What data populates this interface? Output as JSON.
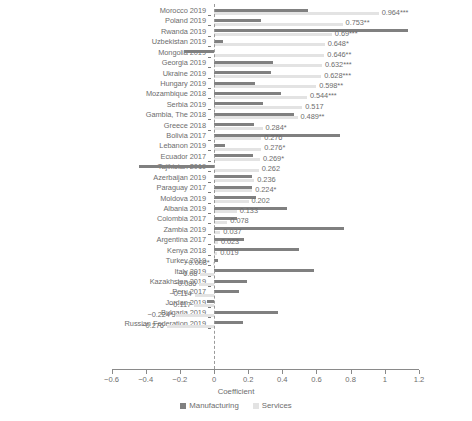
{
  "chart_data": {
    "type": "bar",
    "orientation": "horizontal",
    "title": "",
    "xlabel": "Coefficient",
    "ylabel": "",
    "xlim": [
      -0.6,
      1.2
    ],
    "xticks": [
      -0.6,
      -0.4,
      -0.2,
      0,
      0.2,
      0.4,
      0.6,
      0.8,
      1,
      1.2
    ],
    "xtick_labels": [
      "−0.6",
      "−0.4",
      "−0.2",
      "0",
      "0.2",
      "0.4",
      "0.6",
      "0.8",
      "1",
      "1.2"
    ],
    "grid": false,
    "legend_position": "bottom",
    "zero_reference_line": true,
    "categories": [
      "Morocco 2019",
      "Poland 2019",
      "Rwanda 2019",
      "Uzbekistan 2019",
      "Mongolia 2019",
      "Georgia 2019",
      "Ukraine 2019",
      "Hungary 2019",
      "Mozambique 2018",
      "Serbia 2019",
      "Gambia, The 2018",
      "Greece 2018",
      "Bolivia 2017",
      "Lebanon 2019",
      "Ecuador 2017",
      "Tajikistan 2019",
      "Azerbaijan 2019",
      "Paraguay 2017",
      "Moldova 2019",
      "Albania 2019",
      "Colombia 2017",
      "Zambia 2019",
      "Argentina 2017",
      "Kenya 2018",
      "Turkey 2019",
      "Italy 2019",
      "Kazakhstan 2019",
      "Peru 2017",
      "Jordan 2019",
      "Bulgaria 2019",
      "Russian Federation 2019"
    ],
    "series": [
      {
        "name": "Manufacturing",
        "color": "#808080",
        "values": [
          0.55,
          0.275,
          1.135,
          0.05,
          -0.175,
          0.345,
          0.335,
          0.24,
          0.395,
          0.285,
          0.47,
          0.235,
          0.735,
          0.065,
          0.23,
          -0.44,
          0.22,
          0.225,
          0.245,
          0.43,
          0.135,
          0.76,
          0.175,
          0.495,
          0.025,
          0.585,
          0.195,
          0.145,
          -0.04,
          0.375,
          0.17
        ]
      },
      {
        "name": "Services",
        "color": "#e3e3e3",
        "values": [
          0.964,
          0.753,
          0.69,
          0.648,
          0.646,
          0.632,
          0.628,
          0.598,
          0.544,
          0.517,
          0.489,
          0.284,
          0.276,
          0.276,
          0.269,
          0.262,
          0.236,
          0.224,
          0.202,
          0.133,
          0.078,
          0.037,
          0.023,
          0.019,
          -0.008,
          -0.08,
          -0.086,
          -0.114,
          -0.117,
          -0.224,
          -0.276
        ]
      }
    ],
    "value_labels": [
      "0.964***",
      "0.753**",
      "0.69***",
      "0.648*",
      "0.646**",
      "0.632***",
      "0.628***",
      "0.598**",
      "0.544***",
      "0.517",
      "0.489**",
      "0.284*",
      "0.276",
      "0.276*",
      "0.269*",
      "0.262",
      "0.236",
      "0.224*",
      "0.202",
      "0.133",
      "0.078",
      "0.037",
      "0.023",
      "0.019",
      "−0.008*",
      "−0.08",
      "−0.086",
      "−0.114",
      "−0.117",
      "−0.224*",
      "−0.276"
    ]
  },
  "legend": {
    "items": [
      {
        "label": "Manufacturing",
        "color": "#808080"
      },
      {
        "label": "Services",
        "color": "#e3e3e3"
      }
    ]
  }
}
